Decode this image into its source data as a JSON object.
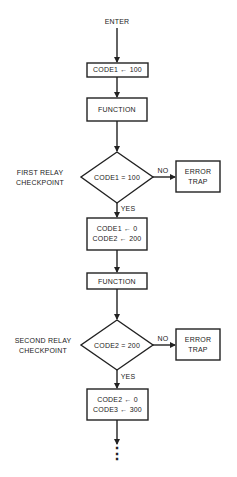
{
  "flowchart": {
    "start": "ENTER",
    "step1": "CODE1 ← 100",
    "function1": "FUNCTION",
    "checkpoint1": {
      "side_label_line1": "FIRST RELAY",
      "side_label_line2": "CHECKPOINT",
      "condition": "CODE1 = 100",
      "no_label": "NO",
      "yes_label": "YES",
      "error_line1": "ERROR",
      "error_line2": "TRAP"
    },
    "step2_line1": "CODE1 ← 0",
    "step2_line2": "CODE2 ← 200",
    "function2": "FUNCTION",
    "checkpoint2": {
      "side_label_line1": "SECOND RELAY",
      "side_label_line2": "CHECKPOINT",
      "condition": "CODE2 = 200",
      "no_label": "NO",
      "yes_label": "YES",
      "error_line1": "ERROR",
      "error_line2": "TRAP"
    },
    "step3_line1": "CODE2 ← 0",
    "step3_line2": "CODE3 ← 300",
    "continuation": "⋮"
  }
}
